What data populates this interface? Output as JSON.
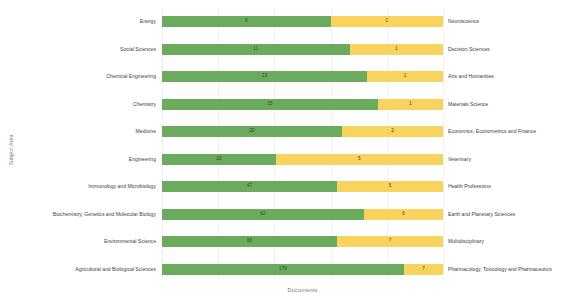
{
  "chart_data": {
    "type": "bar",
    "subtype": "stacked-horizontal-100pct",
    "title": "",
    "xlabel": "Documents",
    "ylabel": "Subject Area",
    "grid": true,
    "legend": null,
    "orientation": "horizontal",
    "stack_order": [
      "green",
      "yellow"
    ],
    "colors": {
      "green": "#6aab5e",
      "yellow": "#f8d35d",
      "gridline": "#eef2f4",
      "text": "#3c4043",
      "axis_title": "#7b7b7b"
    },
    "categories_left": [
      "Energy",
      "Social Sciences",
      "Chemical Engineering",
      "Chemistry",
      "Medicine",
      "Engineering",
      "Immunology and Microbiology",
      "Biochemistry, Genetics and Molecular Biology",
      "Environmental Science",
      "Agricultural and Biological Sciences"
    ],
    "categories_right": [
      "Neuroscience",
      "Decision Sciences",
      "Arts and Humanities",
      "Materials Science",
      "Economics, Econometrics and Finance",
      "Veterinary",
      "Health Professions",
      "Earth and Planetary Sciences",
      "Multidisciplinary",
      "Pharmacology, Toxicology and Pharmaceutics"
    ],
    "series": [
      {
        "name": "left-value",
        "color": "#6aab5e",
        "values": [
          9,
          11,
          13,
          15,
          20,
          32,
          47,
          62,
          66,
          179
        ]
      },
      {
        "name": "right-value",
        "color": "#f8d35d",
        "values": [
          1,
          1,
          1,
          1,
          2,
          5,
          5,
          6,
          7,
          7
        ]
      }
    ],
    "rows": [
      {
        "left_label": "Energy",
        "left_value": 9,
        "right_value": 1,
        "right_label": "Neuroscience",
        "green_pct": 60.0
      },
      {
        "left_label": "Social Sciences",
        "left_value": 11,
        "right_value": 1,
        "right_label": "Decision Sciences",
        "green_pct": 66.8
      },
      {
        "left_label": "Chemical Engineering",
        "left_value": 13,
        "right_value": 1,
        "right_label": "Arts and Humanities",
        "green_pct": 73.0
      },
      {
        "left_label": "Chemistry",
        "left_value": 15,
        "right_value": 1,
        "right_label": "Materials Science",
        "green_pct": 76.9
      },
      {
        "left_label": "Medicine",
        "left_value": 20,
        "right_value": 2,
        "right_label": "Economics, Econometrics and Finance",
        "green_pct": 64.1
      },
      {
        "left_label": "Engineering",
        "left_value": 32,
        "right_value": 5,
        "right_label": "Veterinary",
        "green_pct": 40.5
      },
      {
        "left_label": "Immunology and Microbiology",
        "left_value": 47,
        "right_value": 5,
        "right_label": "Health Professions",
        "green_pct": 62.3
      },
      {
        "left_label": "Biochemistry, Genetics and Molecular Biology",
        "left_value": 62,
        "right_value": 6,
        "right_label": "Earth and Planetary Sciences",
        "green_pct": 71.9
      },
      {
        "left_label": "Environmental Science",
        "left_value": 66,
        "right_value": 7,
        "right_label": "Multidisciplinary",
        "green_pct": 62.3
      },
      {
        "left_label": "Agricultural and Biological Sciences",
        "left_value": 179,
        "right_value": 7,
        "right_label": "Pharmacology, Toxicology and Pharmaceutics",
        "green_pct": 86.1
      }
    ],
    "gridline_positions_pct": [
      0,
      20,
      40,
      60,
      80,
      100
    ]
  }
}
